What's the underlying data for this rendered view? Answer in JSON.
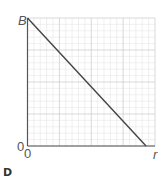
{
  "panel": {
    "label": "D"
  },
  "axes": {
    "y_label": "B",
    "x_label": "r",
    "y_origin_label": "0",
    "x_origin_label": "0"
  },
  "colors": {
    "grid_minor": "#e6e6e6",
    "grid_major": "#cfcfcf",
    "axis": "#555555",
    "line": "#444444"
  },
  "chart_data": {
    "type": "line",
    "title": "",
    "xlabel": "r",
    "ylabel": "B",
    "panel": "D",
    "x": [
      0,
      0.93
    ],
    "series": [
      {
        "name": "B vs r",
        "values": [
          1.0,
          0.0
        ]
      }
    ],
    "xlim": [
      0,
      1
    ],
    "ylim": [
      0,
      1
    ],
    "x_tick_labels": [
      "0"
    ],
    "y_tick_labels": [
      "0",
      "B"
    ],
    "grid": true,
    "grid_minor_divisions": 20,
    "grid_major_every": 5,
    "legend": "none"
  }
}
